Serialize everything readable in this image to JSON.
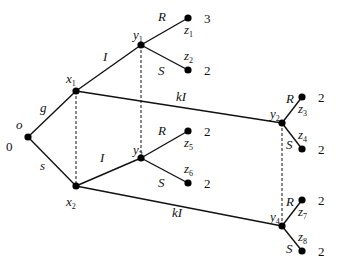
{
  "diagram": {
    "type": "game-tree",
    "nodes": [
      {
        "id": "o",
        "label": "o",
        "sub": "",
        "payoff_label": "0"
      },
      {
        "id": "x1",
        "label": "x",
        "sub": "1"
      },
      {
        "id": "x2",
        "label": "x",
        "sub": "2"
      },
      {
        "id": "y1",
        "label": "y",
        "sub": "1"
      },
      {
        "id": "y2",
        "label": "y",
        "sub": "2"
      },
      {
        "id": "y3",
        "label": "y",
        "sub": "3"
      },
      {
        "id": "y4",
        "label": "y",
        "sub": "4"
      },
      {
        "id": "z1",
        "label": "z",
        "sub": "1",
        "payoff": "3"
      },
      {
        "id": "z2",
        "label": "z",
        "sub": "2",
        "payoff": "2"
      },
      {
        "id": "z3",
        "label": "z",
        "sub": "3",
        "payoff": "2"
      },
      {
        "id": "z4",
        "label": "z",
        "sub": "4",
        "payoff": "2"
      },
      {
        "id": "z5",
        "label": "z",
        "sub": "5",
        "payoff": "2"
      },
      {
        "id": "z6",
        "label": "z",
        "sub": "6",
        "payoff": "2"
      },
      {
        "id": "z7",
        "label": "z",
        "sub": "7",
        "payoff": "2"
      },
      {
        "id": "z8",
        "label": "z",
        "sub": "8",
        "payoff": "2"
      }
    ],
    "edges": [
      {
        "from": "o",
        "to": "x1",
        "label": "g"
      },
      {
        "from": "o",
        "to": "x2",
        "label": "s"
      },
      {
        "from": "x1",
        "to": "y1",
        "label": "I"
      },
      {
        "from": "x1",
        "to": "y2",
        "label": "kI"
      },
      {
        "from": "x2",
        "to": "y3",
        "label": "I"
      },
      {
        "from": "x2",
        "to": "y4",
        "label": "kI"
      },
      {
        "from": "y1",
        "to": "z1",
        "label": "R"
      },
      {
        "from": "y1",
        "to": "z2",
        "label": "S"
      },
      {
        "from": "y2",
        "to": "z3",
        "label": "R"
      },
      {
        "from": "y2",
        "to": "z4",
        "label": "S"
      },
      {
        "from": "y3",
        "to": "z5",
        "label": "R"
      },
      {
        "from": "y3",
        "to": "z6",
        "label": "S"
      },
      {
        "from": "y4",
        "to": "z7",
        "label": "R"
      },
      {
        "from": "y4",
        "to": "z8",
        "label": "S"
      }
    ],
    "information_sets": [
      [
        "x1",
        "x2"
      ],
      [
        "y1",
        "y3"
      ],
      [
        "y2",
        "y4"
      ]
    ]
  }
}
